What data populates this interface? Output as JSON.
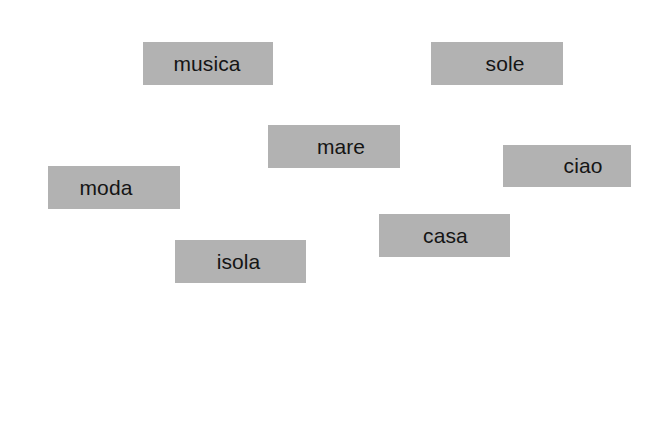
{
  "page": {
    "background_color": "#ffffff"
  },
  "colors": {
    "word_tile_fill": "#b2b2b2",
    "solution_slot_fill": "#d7d7d7",
    "text_color": "#151515"
  },
  "word_tiles": [
    {
      "label": "musica",
      "x": 143,
      "y": 42,
      "width": 130,
      "height": 43
    },
    {
      "label": "sole",
      "x": 431,
      "y": 42,
      "width": 132,
      "height": 43
    },
    {
      "label": "mare",
      "x": 268,
      "y": 125,
      "width": 132,
      "height": 43
    },
    {
      "label": "ciao",
      "x": 503,
      "y": 145,
      "width": 128,
      "height": 42
    },
    {
      "label": "moda",
      "x": 48,
      "y": 166,
      "width": 132,
      "height": 43
    },
    {
      "label": "casa",
      "x": 379,
      "y": 214,
      "width": 131,
      "height": 43
    },
    {
      "label": "isola",
      "x": 175,
      "y": 240,
      "width": 131,
      "height": 43
    }
  ],
  "solution": {
    "label": "Soluzione:",
    "slot_count": 9,
    "slots": [
      "",
      "",
      "",
      "",
      "",
      "",
      "",
      "",
      ""
    ]
  }
}
